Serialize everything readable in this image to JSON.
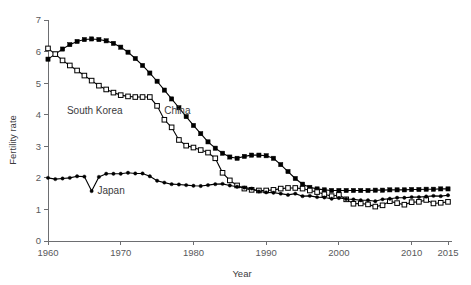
{
  "chart_data": {
    "type": "line",
    "title": "",
    "xlabel": "Year",
    "ylabel": "Fertility rate",
    "xlim": [
      1960,
      2015
    ],
    "ylim": [
      0,
      7
    ],
    "grid": false,
    "legend_position": "inline-annotations",
    "xticks": [
      1960,
      1970,
      1980,
      1990,
      2000,
      2010,
      2015
    ],
    "xtick_labels": [
      "1960",
      "1970",
      "1980",
      "1990",
      "2000",
      "2010",
      "2015"
    ],
    "yticks": [
      0,
      1,
      2,
      3,
      4,
      5,
      6,
      7
    ],
    "ytick_labels": [
      "0",
      "1",
      "2",
      "3",
      "4",
      "5",
      "6",
      "7"
    ],
    "x": [
      1960,
      1961,
      1962,
      1963,
      1964,
      1965,
      1966,
      1967,
      1968,
      1969,
      1970,
      1971,
      1972,
      1973,
      1974,
      1975,
      1976,
      1977,
      1978,
      1979,
      1980,
      1981,
      1982,
      1983,
      1984,
      1985,
      1986,
      1987,
      1988,
      1989,
      1990,
      1991,
      1992,
      1993,
      1994,
      1995,
      1996,
      1997,
      1998,
      1999,
      2000,
      2001,
      2002,
      2003,
      2004,
      2005,
      2006,
      2007,
      2008,
      2009,
      2010,
      2011,
      2012,
      2013,
      2014,
      2015
    ],
    "series": [
      {
        "name": "China",
        "marker": "filled-square",
        "label_text": "China",
        "label_x": 1976.0,
        "label_y": 4.02,
        "values": [
          5.76,
          5.92,
          6.08,
          6.22,
          6.32,
          6.38,
          6.4,
          6.38,
          6.34,
          6.26,
          6.14,
          5.98,
          5.78,
          5.56,
          5.32,
          5.06,
          4.78,
          4.5,
          4.22,
          3.94,
          3.66,
          3.4,
          3.14,
          2.94,
          2.78,
          2.66,
          2.62,
          2.68,
          2.72,
          2.72,
          2.7,
          2.62,
          2.42,
          2.2,
          1.98,
          1.8,
          1.7,
          1.65,
          1.62,
          1.6,
          1.6,
          1.6,
          1.6,
          1.6,
          1.6,
          1.61,
          1.61,
          1.62,
          1.62,
          1.62,
          1.63,
          1.63,
          1.64,
          1.64,
          1.65,
          1.65
        ]
      },
      {
        "name": "South Korea",
        "marker": "open-square",
        "label_text": "South Korea",
        "label_x": 1962.6,
        "label_y": 4.02,
        "values": [
          6.1,
          5.92,
          5.72,
          5.56,
          5.4,
          5.24,
          5.08,
          4.92,
          4.8,
          4.7,
          4.62,
          4.58,
          4.56,
          4.56,
          4.56,
          4.28,
          3.84,
          3.6,
          3.2,
          3.02,
          2.96,
          2.88,
          2.8,
          2.62,
          2.16,
          1.92,
          1.76,
          1.66,
          1.62,
          1.6,
          1.6,
          1.62,
          1.66,
          1.68,
          1.68,
          1.66,
          1.6,
          1.55,
          1.48,
          1.42,
          1.46,
          1.32,
          1.18,
          1.19,
          1.16,
          1.09,
          1.13,
          1.26,
          1.2,
          1.15,
          1.23,
          1.24,
          1.3,
          1.19,
          1.21,
          1.24
        ]
      },
      {
        "name": "Japan",
        "marker": "dot",
        "label_text": "Japan",
        "label_x": 1966.8,
        "label_y": 1.5,
        "values": [
          2.0,
          1.96,
          1.98,
          2.0,
          2.05,
          2.04,
          1.58,
          2.03,
          2.13,
          2.13,
          2.13,
          2.16,
          2.14,
          2.14,
          2.05,
          1.91,
          1.85,
          1.8,
          1.79,
          1.77,
          1.75,
          1.74,
          1.77,
          1.8,
          1.81,
          1.76,
          1.72,
          1.69,
          1.66,
          1.57,
          1.54,
          1.53,
          1.5,
          1.46,
          1.5,
          1.42,
          1.43,
          1.39,
          1.38,
          1.34,
          1.36,
          1.33,
          1.32,
          1.29,
          1.29,
          1.26,
          1.32,
          1.34,
          1.37,
          1.37,
          1.39,
          1.39,
          1.41,
          1.43,
          1.42,
          1.45
        ]
      }
    ]
  },
  "axes": {
    "x_title": "Year",
    "y_title": "Fertility rate"
  }
}
